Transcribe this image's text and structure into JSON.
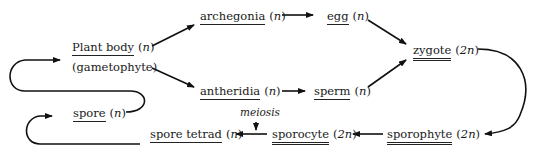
{
  "diagram": {
    "nodes": {
      "plant_body": {
        "term": "Plant body",
        "ploidy": "n",
        "sub": "(gametophyte)"
      },
      "archegonia": {
        "term": "archegonia",
        "ploidy": "n"
      },
      "egg": {
        "term": "egg",
        "ploidy": "n"
      },
      "antheridia": {
        "term": "antheridia",
        "ploidy": "n"
      },
      "sperm": {
        "term": "sperm",
        "ploidy": "n"
      },
      "zygote": {
        "term": "zygote",
        "ploidy": "2n"
      },
      "sporophyte": {
        "term": "sporophyte",
        "ploidy": "2n"
      },
      "sporocyte": {
        "term": "sporocyte",
        "ploidy": "2n"
      },
      "spore_tetrad": {
        "term": "spore tetrad",
        "ploidy": "n"
      },
      "spore": {
        "term": "spore",
        "ploidy": "n"
      }
    },
    "annotations": {
      "meiosis": "meiosis"
    },
    "edges": [
      [
        "plant_body",
        "archegonia"
      ],
      [
        "plant_body",
        "antheridia"
      ],
      [
        "archegonia",
        "egg"
      ],
      [
        "antheridia",
        "sperm"
      ],
      [
        "egg",
        "zygote"
      ],
      [
        "sperm",
        "zygote"
      ],
      [
        "zygote",
        "sporophyte"
      ],
      [
        "sporophyte",
        "sporocyte"
      ],
      [
        "sporocyte",
        "spore_tetrad"
      ],
      [
        "spore_tetrad",
        "spore"
      ],
      [
        "spore",
        "plant_body"
      ]
    ]
  }
}
